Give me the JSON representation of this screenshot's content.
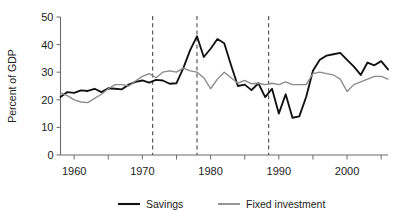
{
  "chart_data": {
    "type": "line",
    "title": "",
    "xlabel": "",
    "ylabel": "Percent of GDP",
    "xlim": [
      1958,
      2006
    ],
    "ylim": [
      0,
      50
    ],
    "grid": false,
    "legend_position": "bottom",
    "y_ticks": [
      0,
      10,
      20,
      30,
      40,
      50
    ],
    "y_tick_labels": [
      "0",
      "10",
      "20",
      "30",
      "40",
      "50"
    ],
    "x_ticks": [
      1960,
      1965,
      1970,
      1975,
      1980,
      1985,
      1990,
      1995,
      2000,
      2005
    ],
    "x_tick_labels": [
      "1960",
      "",
      "1970",
      "",
      "1980",
      "",
      "1990",
      "",
      "2000",
      ""
    ],
    "x_labeled_ticks": [
      1960,
      1970,
      1980,
      1990,
      2000
    ],
    "annotations": [
      {
        "type": "vline",
        "x": 1971.5,
        "style": "dashed"
      },
      {
        "type": "vline",
        "x": 1978.0,
        "style": "dashed"
      },
      {
        "type": "vline",
        "x": 1988.5,
        "style": "dashed"
      }
    ],
    "x": [
      1958,
      1959,
      1960,
      1961,
      1962,
      1963,
      1964,
      1965,
      1966,
      1967,
      1968,
      1969,
      1970,
      1971,
      1972,
      1973,
      1974,
      1975,
      1976,
      1977,
      1978,
      1979,
      1980,
      1981,
      1982,
      1983,
      1984,
      1985,
      1986,
      1987,
      1988,
      1989,
      1990,
      1991,
      1992,
      1993,
      1994,
      1995,
      1996,
      1997,
      1998,
      1999,
      2000,
      2001,
      2002,
      2003,
      2004,
      2005,
      2006
    ],
    "series": [
      {
        "name": "Savings",
        "color": "#111111",
        "values": [
          21.0,
          22.8,
          22.5,
          23.4,
          23.2,
          24.0,
          22.8,
          24.2,
          24.0,
          23.8,
          25.5,
          26.5,
          27.0,
          26.2,
          27.2,
          27.0,
          25.8,
          26.0,
          31.5,
          38.0,
          43.0,
          35.5,
          38.5,
          42.0,
          40.5,
          32.5,
          25.0,
          25.5,
          23.5,
          26.0,
          21.0,
          24.0,
          15.0,
          22.0,
          13.5,
          14.0,
          21.0,
          30.5,
          34.5,
          36.0,
          36.5,
          37.0,
          34.5,
          32.0,
          29.0,
          33.5,
          32.5,
          34.0,
          31.0
        ]
      },
      {
        "name": "Fixed investment",
        "color": "#8a8a8a",
        "values": [
          22.5,
          21.5,
          20.0,
          19.2,
          19.0,
          20.5,
          22.0,
          24.0,
          25.5,
          25.5,
          25.0,
          26.8,
          28.5,
          29.5,
          28.0,
          30.0,
          30.5,
          30.0,
          31.5,
          30.5,
          30.0,
          28.0,
          24.0,
          27.5,
          30.0,
          28.0,
          26.0,
          27.0,
          25.8,
          26.0,
          25.5,
          26.0,
          25.5,
          26.5,
          25.5,
          25.5,
          25.5,
          29.5,
          30.0,
          29.5,
          29.0,
          27.5,
          23.0,
          25.5,
          26.5,
          27.5,
          28.5,
          28.5,
          27.5
        ]
      }
    ],
    "legend": [
      {
        "label": "Savings",
        "color": "#111111"
      },
      {
        "label": "Fixed investment",
        "color": "#8a8a8a"
      }
    ]
  },
  "axis": {
    "y_title": "Percent of GDP"
  }
}
